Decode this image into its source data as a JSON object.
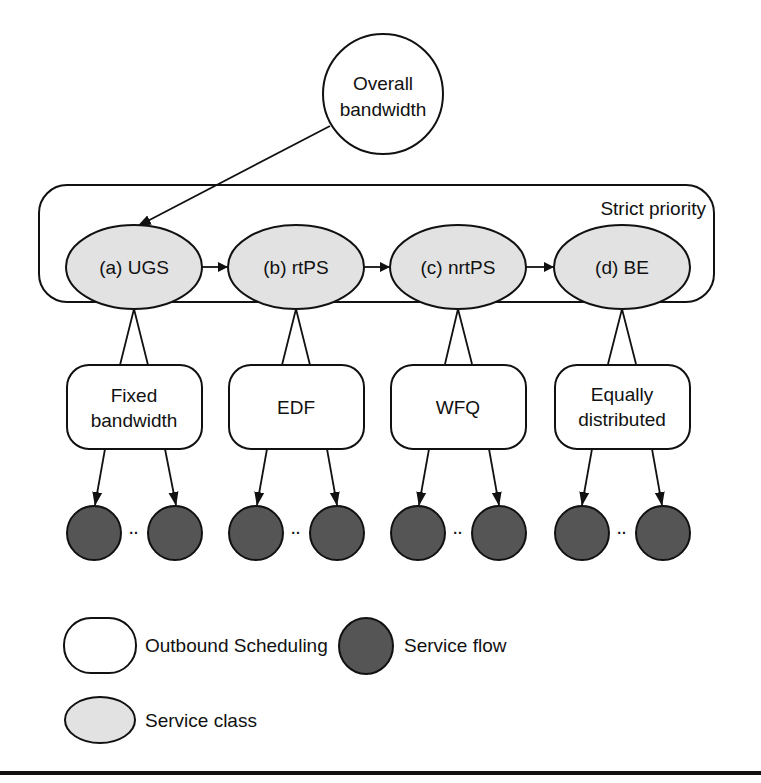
{
  "colors": {
    "service_class_fill": "#e2e2e2",
    "service_flow_fill": "#555555",
    "outbound_fill": "#ffffff",
    "stroke": "#111111"
  },
  "top_node": {
    "line1": "Overall",
    "line2": "bandwidth"
  },
  "group": {
    "label": "Strict priority"
  },
  "service_classes": [
    {
      "label": "(a) UGS"
    },
    {
      "label": "(b) rtPS"
    },
    {
      "label": "(c) nrtPS"
    },
    {
      "label": "(d) BE"
    }
  ],
  "schedulers": [
    {
      "line1": "Fixed",
      "line2": "bandwidth"
    },
    {
      "line1": "EDF",
      "line2": ""
    },
    {
      "line1": "WFQ",
      "line2": ""
    },
    {
      "line1": "Equally",
      "line2": "distributed"
    }
  ],
  "flow_separator": "··",
  "legend": {
    "outbound": "Outbound Scheduling",
    "flow": "Service flow",
    "service_class": "Service class"
  }
}
